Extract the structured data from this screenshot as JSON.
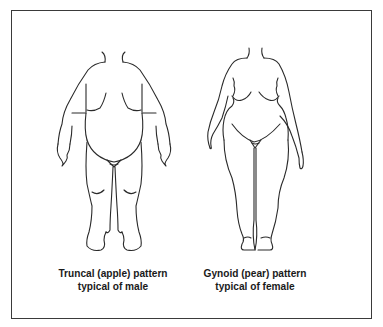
{
  "figure": {
    "panels": [
      {
        "id": "male",
        "caption_line1": "Truncal (apple) pattern",
        "caption_line2": "typical of male"
      },
      {
        "id": "female",
        "caption_line1": "Gynoid (pear) pattern",
        "caption_line2": "typical of female"
      }
    ],
    "colors": {
      "line": "#2a2a2a",
      "border": "#3a3a3a",
      "background": "#ffffff"
    }
  }
}
